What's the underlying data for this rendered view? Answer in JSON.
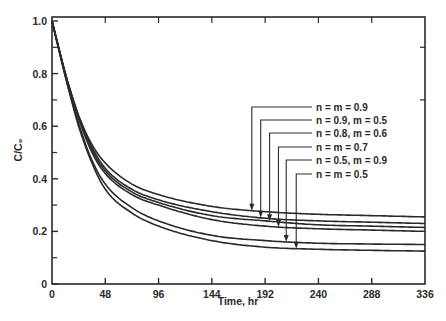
{
  "chart_data": {
    "type": "line",
    "title": "",
    "xlabel": "Time, hr",
    "ylabel": "C/C₀",
    "xlim": [
      0,
      336
    ],
    "ylim": [
      0,
      1.0
    ],
    "grid": false,
    "legend_position": "annotated leader lines, center-right",
    "x_ticks": [
      0,
      48,
      96,
      144,
      192,
      240,
      288,
      336
    ],
    "x_tick_labels": [
      "0",
      "48",
      "96",
      "144",
      "192",
      "240",
      "288",
      "336"
    ],
    "y_ticks": [
      0,
      0.2,
      0.4,
      0.6,
      0.8,
      1.0
    ],
    "y_tick_labels": [
      "0",
      "0.2",
      "0.4",
      "0.6",
      "0.8",
      "1.0"
    ],
    "y_minor_ticks": [
      0.1,
      0.3,
      0.5,
      0.7,
      0.9
    ],
    "x": [
      0,
      12,
      24,
      36,
      48,
      72,
      96,
      144,
      192,
      240,
      288,
      336
    ],
    "series": [
      {
        "name": "n = m = 0.9",
        "values": [
          1.0,
          0.8,
          0.64,
          0.53,
          0.46,
          0.38,
          0.34,
          0.295,
          0.275,
          0.265,
          0.26,
          0.255
        ],
        "arrow_at": 180
      },
      {
        "name": "n = 0.9, m = 0.5",
        "values": [
          1.0,
          0.8,
          0.64,
          0.52,
          0.44,
          0.36,
          0.32,
          0.275,
          0.25,
          0.24,
          0.235,
          0.23
        ],
        "arrow_at": 188
      },
      {
        "name": "n = 0.8, m = 0.6",
        "values": [
          1.0,
          0.8,
          0.63,
          0.51,
          0.43,
          0.35,
          0.31,
          0.26,
          0.24,
          0.225,
          0.22,
          0.215
        ],
        "arrow_at": 196
      },
      {
        "name": "n = m = 0.7",
        "values": [
          1.0,
          0.8,
          0.63,
          0.5,
          0.42,
          0.34,
          0.3,
          0.245,
          0.22,
          0.21,
          0.205,
          0.2
        ],
        "arrow_at": 204
      },
      {
        "name": "n = 0.5, m = 0.9",
        "values": [
          1.0,
          0.79,
          0.61,
          0.47,
          0.38,
          0.29,
          0.24,
          0.185,
          0.165,
          0.155,
          0.152,
          0.15
        ],
        "arrow_at": 211
      },
      {
        "name": "n = m = 0.5",
        "values": [
          1.0,
          0.79,
          0.6,
          0.46,
          0.36,
          0.27,
          0.22,
          0.165,
          0.14,
          0.132,
          0.128,
          0.125
        ],
        "arrow_at": 220
      }
    ],
    "line_color": "#2a2a2a"
  }
}
